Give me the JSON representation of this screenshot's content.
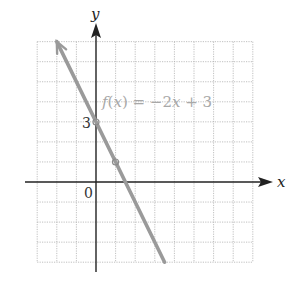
{
  "chart_data": {
    "type": "line",
    "title": "",
    "xlabel": "x",
    "ylabel": "y",
    "xlim": [
      -3,
      8
    ],
    "ylim": [
      -4,
      7
    ],
    "grid": true,
    "grid_style": "dotted",
    "series": [
      {
        "name": "f(x) = −2x + 3",
        "equation": "f(x) = -2x + 3",
        "slope": -2,
        "intercept": 3,
        "x": [
          -2,
          0,
          1,
          3.5
        ],
        "y": [
          7,
          3,
          1,
          -4
        ],
        "color": "#9a9a9a",
        "arrow_at_start": true
      }
    ],
    "marked_points": [
      {
        "x": 0,
        "y": 3
      },
      {
        "x": 1,
        "y": 1
      }
    ],
    "annotations": [
      {
        "text": "f(x) = −2x + 3",
        "x": 0.25,
        "y": 3.8
      },
      {
        "text": "3",
        "x": -0.5,
        "y": 3
      },
      {
        "text": "0",
        "x": -0.5,
        "y": -0.5
      }
    ]
  },
  "labels": {
    "x_axis": "x",
    "y_axis": "y",
    "origin": "0",
    "y_intercept_tick": "3",
    "function_f": "f",
    "function_open": "(",
    "function_var": "x",
    "function_close": ")",
    "function_rest_1": " = −2",
    "function_var2": "x",
    "function_rest_2": " + 3"
  },
  "colors": {
    "line": "#9a9a9a",
    "axis": "#222222",
    "grid": "#b0b0b0",
    "label_function": "#a8a8a8"
  }
}
